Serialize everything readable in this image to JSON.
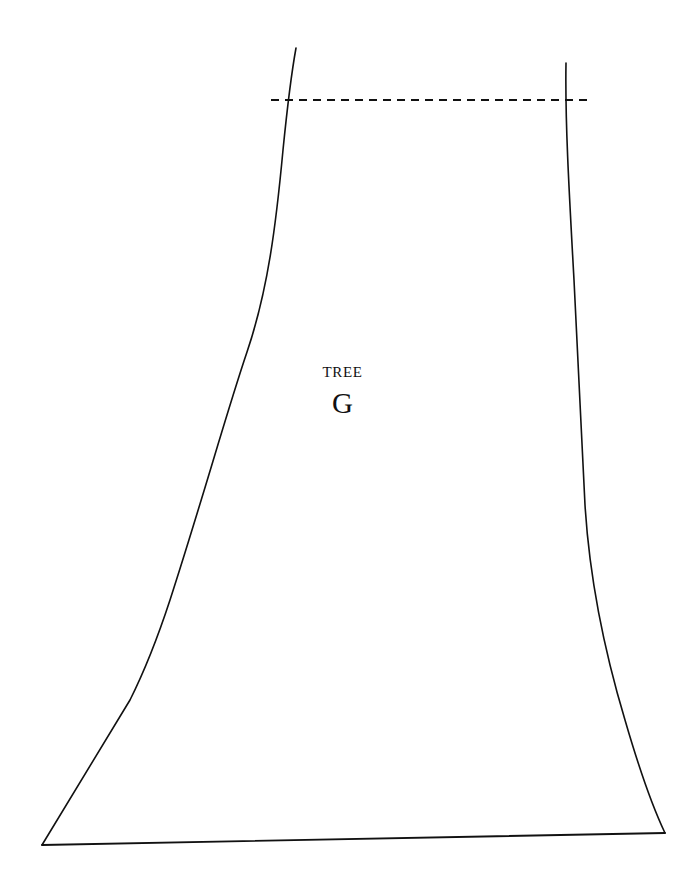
{
  "page": {
    "width": 685,
    "height": 892,
    "background_color": "#ffffff",
    "ink_color": "#111111"
  },
  "pattern": {
    "piece_label": "TREE",
    "piece_letter": "G",
    "line_color": "#111111",
    "line_width": 1.6,
    "marking_line_style": "dashed",
    "marking_dash_pattern": "8 6"
  },
  "geometry": {
    "left_seam_path": "M 296 48 C 292 70, 288 100, 283 150 C 276 225, 268 290, 247 352 C 226 414, 203 498, 170 600 C 152 655, 140 680, 130 700 L 42 845",
    "right_seam_path": "M 566 63 C 565 120, 569 190, 574 280 C 578 360, 582 440, 585 505 C 589 570, 601 640, 625 720 C 641 775, 655 812, 665 833",
    "bottom_hem_path": "M 42 845 L 665 833",
    "marking_line": {
      "x1": 271,
      "y1": 100,
      "x2": 591,
      "y2": 100
    },
    "label_center_x": 402,
    "label_name_y": 376,
    "label_letter_y": 410
  }
}
